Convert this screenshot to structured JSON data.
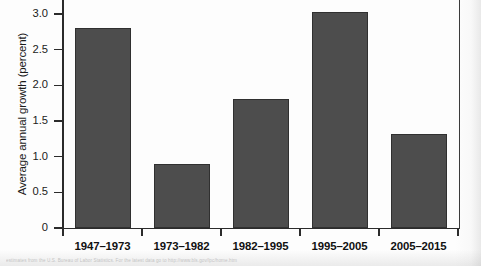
{
  "chart_data": {
    "type": "bar",
    "title": "",
    "subtitle": "",
    "xlabel": "",
    "ylabel": "Average annual growth (percent)",
    "categories": [
      "1947–1973",
      "1973–1982",
      "1982–1995",
      "1995–2005",
      "2005–2015"
    ],
    "values": [
      2.8,
      0.9,
      1.81,
      3.03,
      1.32
    ],
    "ylim": [
      0,
      3.2
    ],
    "yticks": [
      0,
      0.5,
      1.0,
      1.5,
      2.0,
      2.5,
      3.0
    ],
    "ytick_labels": [
      "0",
      "0.5",
      "1.0",
      "1.5",
      "2.0",
      "2.5",
      "3.0"
    ],
    "grid": false,
    "legend": null,
    "bar_color": "#4d4d4d",
    "bar_border_color": "#303030",
    "axis_color": "#2b2b2b"
  },
  "axes": {
    "y_title": "Average annual growth (percent)"
  },
  "caption": {
    "text": "estimates from the U.S. Bureau of Labor Statistics. For the latest data go to http://www.bls.gov/lpc/home.htm"
  }
}
